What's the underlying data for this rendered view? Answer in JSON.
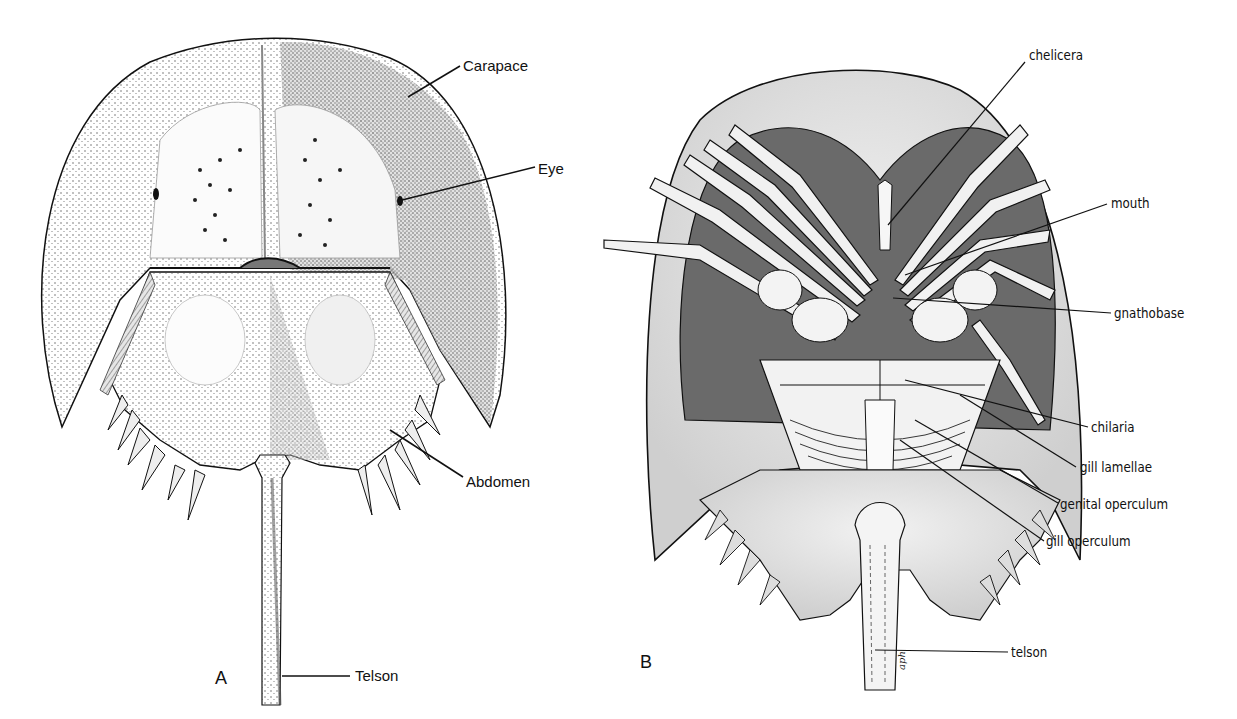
{
  "figure": {
    "panels": [
      {
        "id": "A",
        "letter": "A",
        "view": "dorsal",
        "labels": [
          {
            "text": "Carapace",
            "x": 463,
            "y": 66
          },
          {
            "text": "Eye",
            "x": 538,
            "y": 170
          },
          {
            "text": "Abdomen",
            "x": 466,
            "y": 482
          },
          {
            "text": "Telson",
            "x": 355,
            "y": 668
          }
        ]
      },
      {
        "id": "B",
        "letter": "B",
        "view": "ventral",
        "labels": [
          {
            "text": "chelicera",
            "x": 1029,
            "y": 57
          },
          {
            "text": "mouth",
            "x": 1111,
            "y": 201
          },
          {
            "text": "gnathobase",
            "x": 1114,
            "y": 312
          },
          {
            "text": "chilaria",
            "x": 1091,
            "y": 427
          },
          {
            "text": "gill lamellae",
            "x": 1080,
            "y": 467
          },
          {
            "text": "genital operculum",
            "x": 1060,
            "y": 504
          },
          {
            "text": "gill operculum",
            "x": 1046,
            "y": 541
          },
          {
            "text": "telson",
            "x": 1011,
            "y": 652
          }
        ]
      }
    ],
    "signature": "aph"
  }
}
